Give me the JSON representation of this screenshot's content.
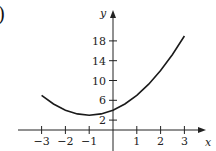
{
  "panel_label": ")",
  "chart_data": {
    "type": "line",
    "title": "",
    "xlabel": "x",
    "ylabel": "y",
    "xlim": [
      -3.4,
      3.9
    ],
    "ylim": [
      -2,
      22
    ],
    "x_ticks": [
      -3,
      -2,
      -1,
      1,
      2,
      3
    ],
    "x_tick_labels": [
      "−3",
      "−2",
      "−1",
      "1",
      "2",
      "3"
    ],
    "y_ticks": [
      2,
      6,
      10,
      14,
      18
    ],
    "y_tick_labels": [
      "2",
      "6",
      "10",
      "14",
      "18"
    ],
    "grid": false,
    "legend": null,
    "series": [
      {
        "name": "curve",
        "x": [
          -3,
          -2.5,
          -2,
          -1.5,
          -1,
          -0.5,
          0,
          0.5,
          1,
          1.5,
          2,
          2.5,
          3
        ],
        "values": [
          7,
          5.25,
          4,
          3.25,
          3,
          3.25,
          4,
          5.25,
          7,
          9.25,
          12,
          15.25,
          19
        ]
      }
    ]
  },
  "colors": {
    "axis": "#222222",
    "curve": "#1a1a1a",
    "text": "#222222"
  }
}
